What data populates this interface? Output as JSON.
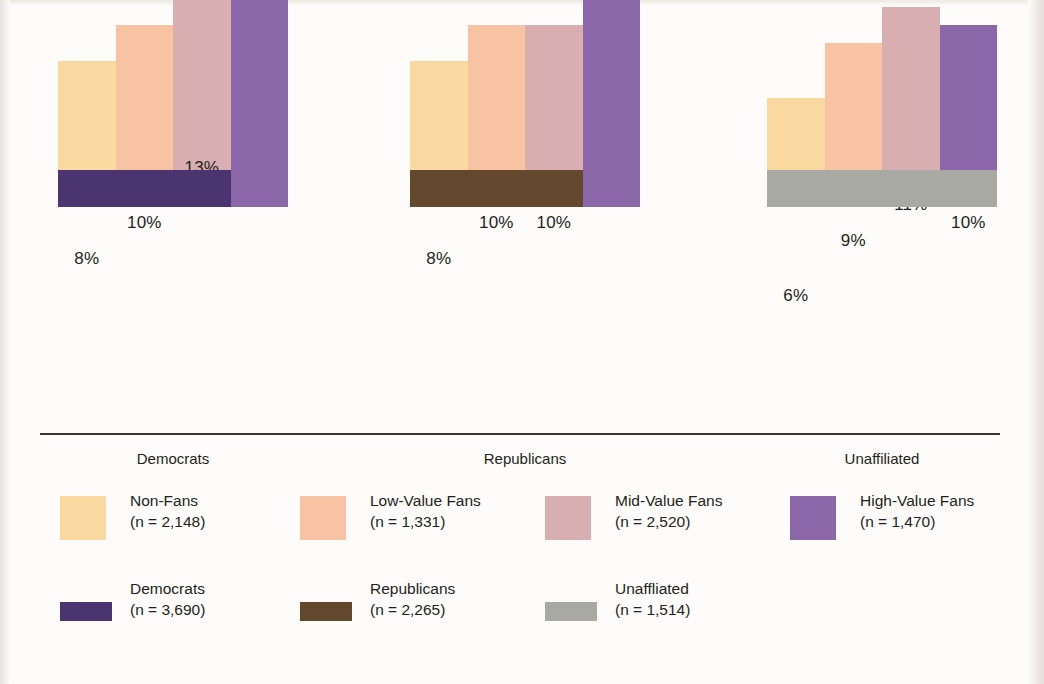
{
  "chart_data": {
    "type": "bar",
    "title": "",
    "subtitle": "",
    "xlabel": "",
    "ylabel": "",
    "grid": false,
    "ylim": [
      0,
      22
    ],
    "value_suffix": "%",
    "legend_position": "bottom",
    "categories": [
      "Democrats",
      "Republicans",
      "Unaffiliated"
    ],
    "series": [
      {
        "name": "Non-Fans",
        "color": "#fad9a0",
        "values": [
          8,
          8,
          6
        ]
      },
      {
        "name": "Low-Value Fans",
        "color": "#f7c3a2",
        "values": [
          10,
          10,
          9
        ]
      },
      {
        "name": "Mid-Value Fans",
        "color": "#d9aeb0",
        "values": [
          13,
          10,
          11
        ]
      },
      {
        "name": "High-Value Fans",
        "color": "#8b66a8",
        "values": [
          20,
          16,
          10
        ]
      }
    ],
    "group_bands": [
      {
        "name": "Democrats",
        "color": "#4b3571"
      },
      {
        "name": "Republicans",
        "color": "#64482e"
      },
      {
        "name": "Unaffiliated",
        "color": "#a9a9a4"
      }
    ],
    "data_labels": [
      [
        "8%",
        "10%",
        "13%",
        "20%"
      ],
      [
        "8%",
        "10%",
        "10%",
        "16%"
      ],
      [
        "6%",
        "9%",
        "11%",
        "10%"
      ]
    ]
  },
  "axis": {
    "group_labels": [
      "Democrats",
      "Republicans",
      "Unaffiliated"
    ]
  },
  "legend": {
    "row1": [
      {
        "label": "Non-Fans",
        "count": "(n = 2,148)",
        "color": "#fad9a0",
        "swatch": "square"
      },
      {
        "label": "Low-Value Fans",
        "count": "(n = 1,331)",
        "color": "#f7c3a2",
        "swatch": "square"
      },
      {
        "label": "Mid-Value Fans",
        "count": "(n = 2,520)",
        "color": "#d9aeb0",
        "swatch": "square"
      },
      {
        "label": "High-Value Fans",
        "count": "(n = 1,470)",
        "color": "#8b66a8",
        "swatch": "square"
      }
    ],
    "row2": [
      {
        "label": "Democrats",
        "count": "(n = 3,690)",
        "color": "#4b3571",
        "swatch": "band"
      },
      {
        "label": "Republicans",
        "count": "(n = 2,265)",
        "color": "#64482e",
        "swatch": "band"
      },
      {
        "label": "Unaffliated",
        "count": "(n = 1,514)",
        "color": "#a9a9a4",
        "swatch": "band"
      }
    ]
  },
  "geometry": {
    "baseline_y": 421,
    "px_per_percent": 18.2,
    "band_height": 37,
    "bar_width": 57.5,
    "group_left": [
      58,
      410,
      767
    ],
    "legend_row1_x": [
      60,
      300,
      545,
      790
    ],
    "legend_row2_x": [
      60,
      300,
      545
    ]
  }
}
